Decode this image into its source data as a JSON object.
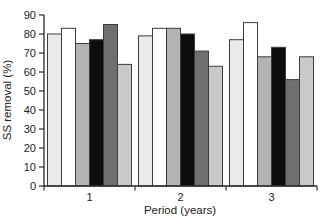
{
  "figure": {
    "background": "#fefefe"
  },
  "chart_data": {
    "type": "bar",
    "title": "",
    "xlabel": "Period (years)",
    "ylabel": "SS removal (%)",
    "categories": [
      "1",
      "2",
      "3"
    ],
    "ylim": [
      0,
      90
    ],
    "yticks": [
      0,
      10,
      20,
      30,
      40,
      50,
      60,
      70,
      80,
      90
    ],
    "grid": false,
    "legend": "none",
    "axis_color": "#2b2b2b",
    "text_color": "#1c1c1c",
    "bar_outline_color": "#3d3d3d",
    "series": [
      {
        "color": "#eaeaea",
        "values": [
          80,
          79,
          77
        ]
      },
      {
        "color": "#ffffff",
        "values": [
          83,
          83,
          86
        ]
      },
      {
        "color": "#b3b3b3",
        "values": [
          75,
          83,
          68
        ]
      },
      {
        "color": "#0d0d0d",
        "values": [
          77,
          80,
          73
        ]
      },
      {
        "color": "#6f6f6f",
        "values": [
          85,
          71,
          56
        ]
      },
      {
        "color": "#c9c9c9",
        "values": [
          64,
          63,
          68
        ]
      }
    ]
  }
}
